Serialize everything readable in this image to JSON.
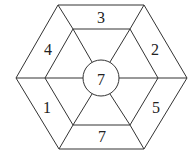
{
  "diagram": {
    "type": "nested-hexagon-puzzle",
    "line_color": "#333333",
    "center": {
      "label": "7"
    },
    "outer_ring_labels": {
      "top": "3",
      "upper_right": "2",
      "lower_right": "5",
      "bottom": "7",
      "lower_left": "1",
      "upper_left": "4"
    }
  }
}
